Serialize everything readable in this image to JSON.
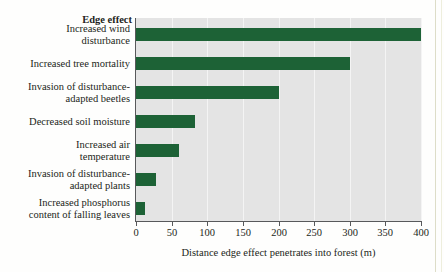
{
  "chart_data": {
    "type": "bar",
    "orientation": "horizontal",
    "title": "Edge effect",
    "xlabel": "Distance edge effect penetrates into forest (m)",
    "ylabel": "",
    "xlim": [
      0,
      400
    ],
    "xticks": [
      0,
      50,
      100,
      150,
      200,
      250,
      300,
      350,
      400
    ],
    "grid": "vertical-white-gridlines",
    "legend": "none",
    "plot_background": "#e4e4e4",
    "bar_color": "#1d6236",
    "categories": [
      "Increased wind disturbance",
      "Increased tree mortality",
      "Invasion of disturbance-adapted beetles",
      "Decreased soil moisture",
      "Increased air temperature",
      "Invasion of disturbance-adapted plants",
      "Increased phosphorus content of falling leaves"
    ],
    "category_lines": [
      [
        "Increased wind",
        "disturbance"
      ],
      [
        "Increased tree mortality"
      ],
      [
        "Invasion of disturbance-",
        "adapted beetles"
      ],
      [
        "Decreased soil moisture"
      ],
      [
        "Increased air",
        "temperature"
      ],
      [
        "Invasion of disturbance-",
        "adapted plants"
      ],
      [
        "Increased phosphorus",
        "content of falling leaves"
      ]
    ],
    "values": [
      400,
      300,
      200,
      83,
      60,
      28,
      12
    ]
  }
}
